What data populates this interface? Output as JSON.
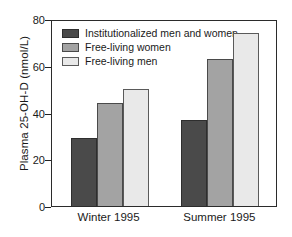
{
  "chart_data": {
    "type": "bar",
    "title": "",
    "xlabel": "",
    "ylabel": "Plasma 25-OH-D (nmol/L)",
    "categories": [
      "Winter 1995",
      "Summer 1995"
    ],
    "series": [
      {
        "name": "Institutionalized men and women",
        "color": "#4a4a4a",
        "values": [
          29,
          37
        ]
      },
      {
        "name": "Free-living women",
        "color": "#a3a3a3",
        "values": [
          44,
          63
        ]
      },
      {
        "name": "Free-living men",
        "color": "#e9e9e9",
        "values": [
          50,
          74
        ]
      }
    ],
    "ylim": [
      0,
      80
    ],
    "yticks": [
      0,
      20,
      40,
      60,
      80
    ],
    "ytick_labels": [
      "0",
      "20",
      "40",
      "60",
      "80"
    ],
    "grid": false,
    "legend_position": "upper-left-inside",
    "frame": "box"
  }
}
